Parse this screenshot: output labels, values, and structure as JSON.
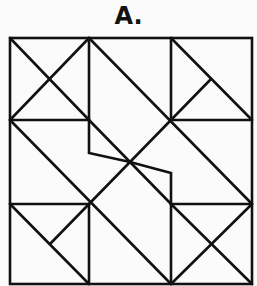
{
  "figure": {
    "label": "A.",
    "stroke_color": "#111111",
    "background_color": "#fbfbfb"
  }
}
